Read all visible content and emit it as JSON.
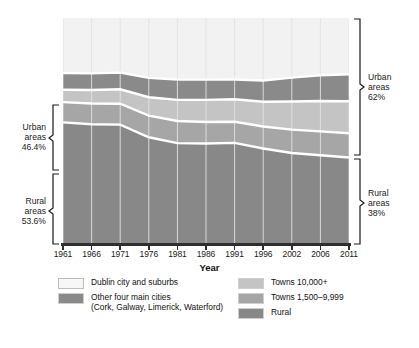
{
  "chart_data": {
    "type": "area",
    "stacked": true,
    "normalized_percent": true,
    "title": "",
    "xlabel": "Year",
    "ylabel": "",
    "ylim": [
      0,
      100
    ],
    "grid": "vertical",
    "legend_position": "bottom",
    "categories": [
      "1961",
      "1966",
      "1971",
      "1976",
      "1981",
      "1986",
      "1991",
      "1996",
      "2002",
      "2006",
      "2011"
    ],
    "x": [
      1961,
      1966,
      1971,
      1976,
      1981,
      1986,
      1991,
      1996,
      2002,
      2006,
      2011
    ],
    "series": [
      {
        "name": "Rural",
        "color": "#888888",
        "values": [
          53.6,
          52.8,
          52.6,
          47.0,
          44.4,
          44.2,
          44.5,
          42.0,
          40.0,
          39.0,
          38.0
        ]
      },
      {
        "name": "Towns 1,500–9,999",
        "color": "#a6a6a6",
        "values": [
          9.0,
          9.2,
          9.3,
          9.6,
          9.8,
          9.6,
          9.4,
          9.8,
          10.4,
          10.6,
          10.8
        ]
      },
      {
        "name": "Towns 10,000+",
        "color": "#c4c4c4",
        "values": [
          5.5,
          6.0,
          6.4,
          8.2,
          9.4,
          9.8,
          10.0,
          11.0,
          12.5,
          13.5,
          14.2
        ]
      },
      {
        "name": "Other four main cities (Cork, Galway, Limerick, Waterford)",
        "color": "#8a8a8a",
        "values": [
          7.4,
          7.4,
          7.4,
          8.6,
          9.0,
          9.0,
          8.8,
          9.4,
          10.6,
          11.4,
          12.0
        ]
      },
      {
        "name": "Dublin city and suburbs",
        "color": "#f2f2f2",
        "values": [
          24.5,
          24.6,
          24.3,
          26.6,
          27.4,
          27.4,
          27.3,
          27.8,
          26.5,
          25.5,
          25.0
        ]
      }
    ],
    "annotations": {
      "left_urban": {
        "label": "Urban\nareas",
        "value": "46.4%",
        "year": 1961
      },
      "left_rural": {
        "label": "Rural\nareas",
        "value": "53.6%",
        "year": 1961
      },
      "right_urban": {
        "label": "Urban\nareas",
        "value": "62%",
        "year": 2011
      },
      "right_rural": {
        "label": "Rural\nareas",
        "value": "38%",
        "year": 2011
      }
    }
  },
  "axis": {
    "x_title": "Year",
    "ticks": [
      "1961",
      "1966",
      "1971",
      "1976",
      "1981",
      "1986",
      "1991",
      "1996",
      "2002",
      "2006",
      "2011"
    ]
  },
  "side_labels": {
    "left_urban_l1": "Urban",
    "left_urban_l2": "areas",
    "left_urban_l3": "46.4%",
    "left_rural_l1": "Rural",
    "left_rural_l2": "areas",
    "left_rural_l3": "53.6%",
    "right_urban_l1": "Urban",
    "right_urban_l2": "areas",
    "right_urban_l3": "62%",
    "right_rural_l1": "Rural",
    "right_rural_l2": "areas",
    "right_rural_l3": "38%"
  },
  "legend": {
    "left_items": [
      {
        "label": "Dublin city and suburbs",
        "sub": "",
        "color": "#f7f7f7"
      },
      {
        "label": "Other four main cities",
        "sub": "(Cork, Galway, Limerick, Waterford)",
        "color": "#8a8a8a"
      }
    ],
    "right_items": [
      {
        "label": "Towns 10,000+",
        "sub": "",
        "color": "#c4c4c4"
      },
      {
        "label": "Towns 1,500–9,999",
        "sub": "",
        "color": "#a6a6a6"
      },
      {
        "label": "Rural",
        "sub": "",
        "color": "#888888"
      }
    ]
  },
  "colors": {
    "dublin": "#f7f7f7",
    "cities": "#8a8a8a",
    "towns10k": "#c4c4c4",
    "towns15k": "#a6a6a6",
    "rural": "#888888",
    "separator": "#ffffff",
    "gridline": "#e2e2e2",
    "axis": "#2f2f2f",
    "text": "#111111"
  }
}
